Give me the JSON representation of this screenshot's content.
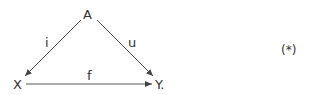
{
  "diagram": {
    "type": "commutative-triangle",
    "nodes": {
      "A": {
        "label": "A"
      },
      "X": {
        "label": "X"
      },
      "Y": {
        "label": "Y."
      }
    },
    "edges": [
      {
        "from": "A",
        "to": "X",
        "label": "i"
      },
      {
        "from": "A",
        "to": "Y",
        "label": "u"
      },
      {
        "from": "X",
        "to": "Y",
        "label": "f"
      }
    ],
    "equation_tag": "(*)",
    "colors": {
      "ink": "#333333",
      "background": "#ffffff"
    }
  }
}
